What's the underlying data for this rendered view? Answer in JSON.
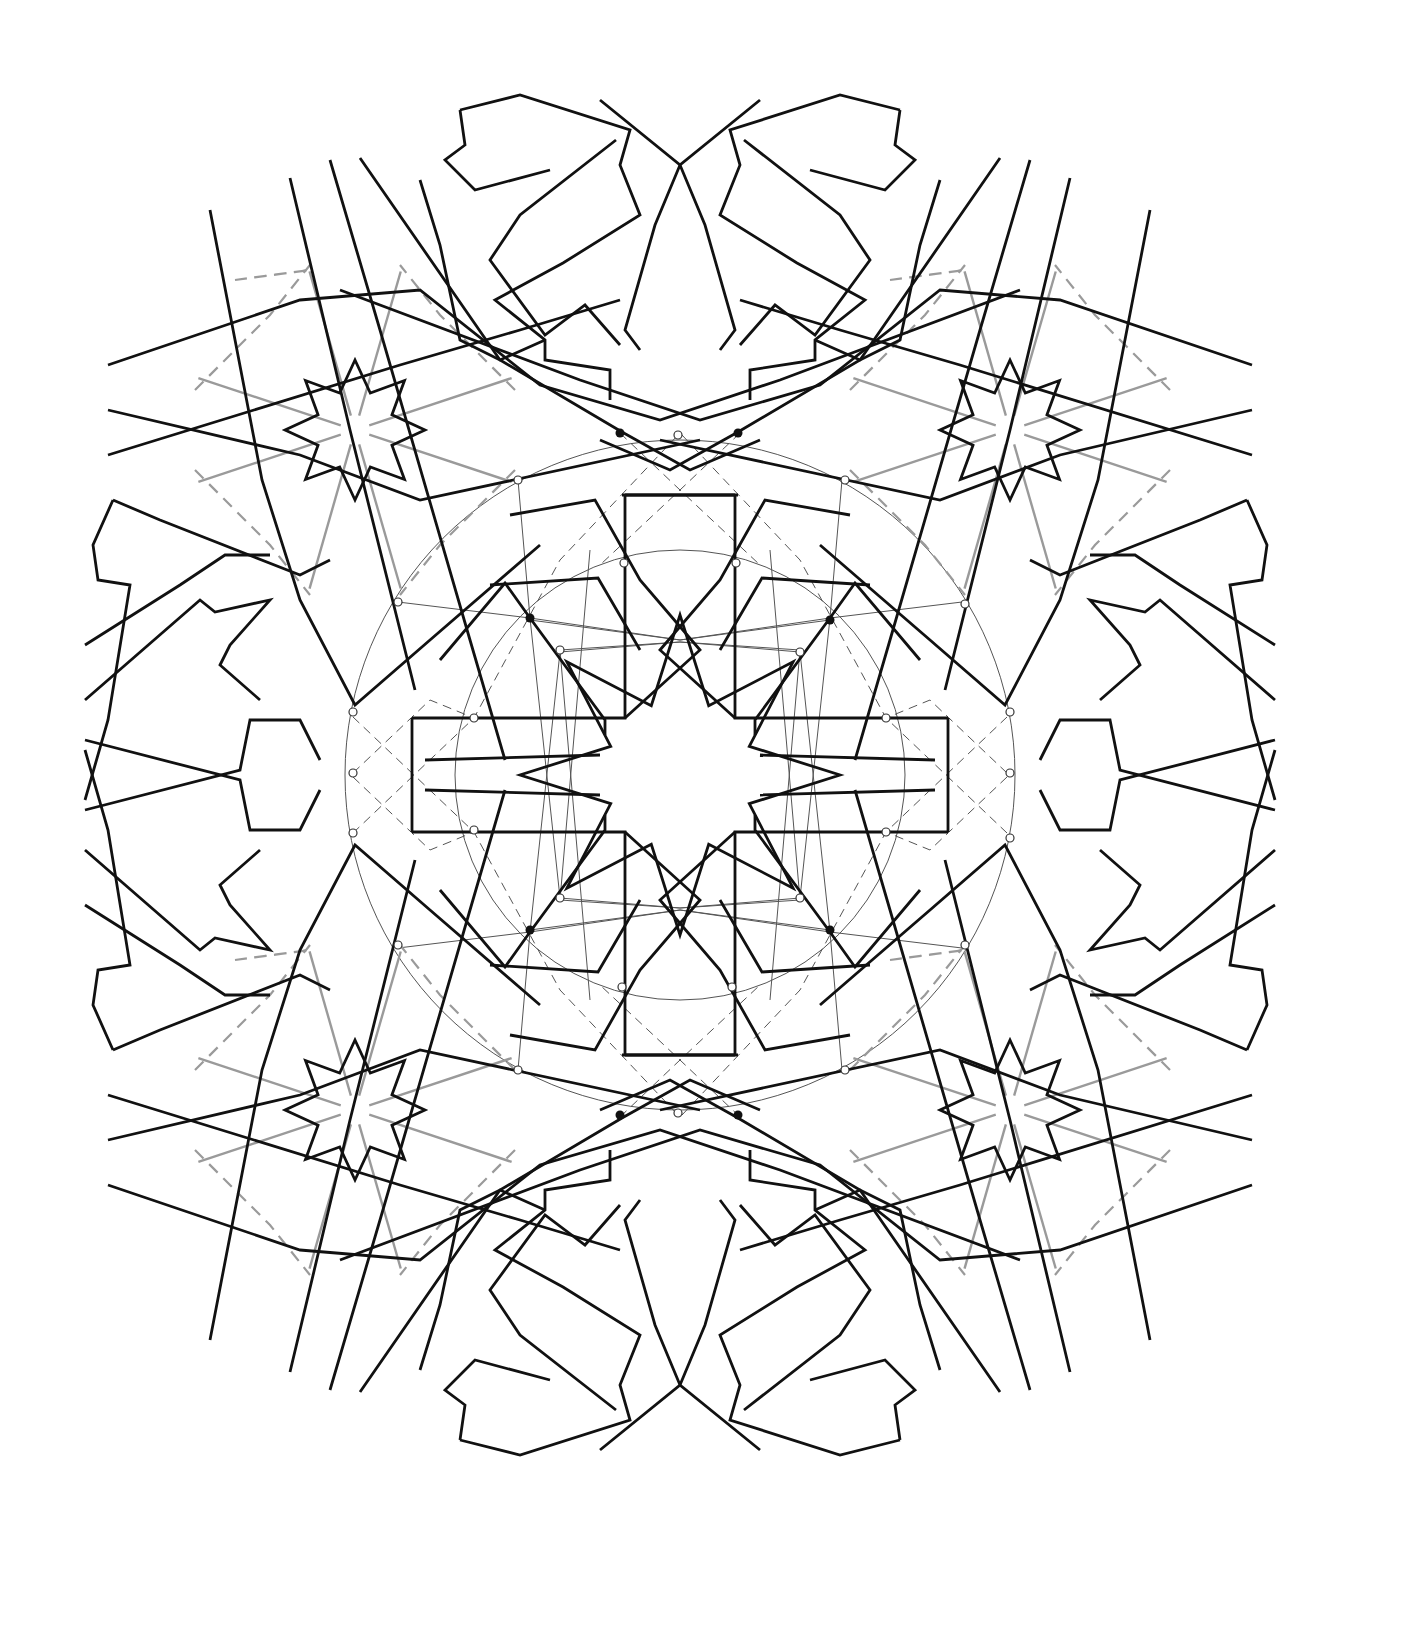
{
  "diagram": {
    "title": "",
    "center": [
      680,
      775
    ],
    "colors": {
      "pattern_line": "#111111",
      "guide_line": "#9a9a9a",
      "construction_line": "#555555",
      "background": "#ffffff"
    },
    "central_star": {
      "points": 8,
      "outer_radius": 160,
      "inner_radius": 75,
      "rotation_deg": 0
    },
    "corner_rosettes": [
      {
        "cx": 355,
        "cy": 430
      },
      {
        "cx": 1010,
        "cy": 430
      },
      {
        "cx": 355,
        "cy": 1110
      },
      {
        "cx": 1010,
        "cy": 1110
      }
    ],
    "rosette_star": {
      "points": 8,
      "outer_radius": 70,
      "inner_radius": 40
    },
    "construction_circles": [
      {
        "cx": 680,
        "cy": 775,
        "r": 335
      },
      {
        "cx": 680,
        "cy": 775,
        "r": 225
      }
    ],
    "dark_nodes": [
      [
        530,
        618
      ],
      [
        830,
        620
      ],
      [
        530,
        930
      ],
      [
        830,
        930
      ],
      [
        620,
        433
      ],
      [
        738,
        433
      ],
      [
        620,
        1115
      ],
      [
        738,
        1115
      ]
    ],
    "open_nodes": [
      [
        678,
        435
      ],
      [
        678,
        1113
      ],
      [
        518,
        480
      ],
      [
        845,
        480
      ],
      [
        518,
        1070
      ],
      [
        845,
        1070
      ],
      [
        398,
        602
      ],
      [
        965,
        604
      ],
      [
        398,
        945
      ],
      [
        965,
        945
      ],
      [
        560,
        650
      ],
      [
        800,
        652
      ],
      [
        560,
        898
      ],
      [
        800,
        898
      ],
      [
        353,
        712
      ],
      [
        353,
        773
      ],
      [
        353,
        833
      ],
      [
        1010,
        712
      ],
      [
        1010,
        773
      ],
      [
        1010,
        838
      ],
      [
        624,
        563
      ],
      [
        736,
        563
      ],
      [
        622,
        987
      ],
      [
        732,
        987
      ],
      [
        474,
        718
      ],
      [
        474,
        830
      ],
      [
        886,
        718
      ],
      [
        886,
        832
      ]
    ]
  }
}
